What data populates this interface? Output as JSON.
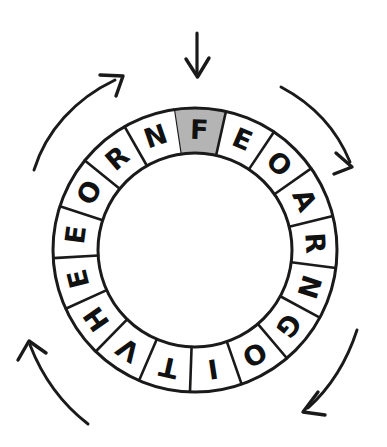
{
  "diagram": {
    "type": "cipher-wheel",
    "geometry": {
      "center_x": 195,
      "center_y": 250,
      "outer_radius": 142,
      "inner_radius": 97,
      "segment_count": 17,
      "start_angle_deg": -98.6,
      "segment_span_deg": 21.18
    },
    "colors": {
      "ink": "#1a1a1a",
      "segment_fill": "#ffffff",
      "highlight_fill": "#b4b4b4",
      "page": "#ffffff"
    },
    "segments": [
      {
        "index": 0,
        "letter": "F",
        "highlighted": true
      },
      {
        "index": 1,
        "letter": "E",
        "highlighted": false
      },
      {
        "index": 2,
        "letter": "O",
        "highlighted": false
      },
      {
        "index": 3,
        "letter": "A",
        "highlighted": false
      },
      {
        "index": 4,
        "letter": "R",
        "highlighted": false
      },
      {
        "index": 5,
        "letter": "N",
        "highlighted": false
      },
      {
        "index": 6,
        "letter": "G",
        "highlighted": false
      },
      {
        "index": 7,
        "letter": "O",
        "highlighted": false
      },
      {
        "index": 8,
        "letter": "I",
        "highlighted": false
      },
      {
        "index": 9,
        "letter": "T",
        "highlighted": false
      },
      {
        "index": 10,
        "letter": "V",
        "highlighted": false
      },
      {
        "index": 11,
        "letter": "H",
        "highlighted": false
      },
      {
        "index": 12,
        "letter": "E",
        "highlighted": false
      },
      {
        "index": 13,
        "letter": "E",
        "highlighted": false
      },
      {
        "index": 14,
        "letter": "O",
        "highlighted": false
      },
      {
        "index": 15,
        "letter": "R",
        "highlighted": false
      },
      {
        "index": 16,
        "letter": "N",
        "highlighted": false
      }
    ],
    "sequence_clockwise": "FEOARNGOITVHEEORN",
    "pointer": {
      "name": "down-arrow",
      "direction": "down",
      "target_segment_letter": "F",
      "tip_x": 197,
      "tip_y": 78
    },
    "rotation_arcs": [
      {
        "name": "arc-arrow-top-left",
        "direction": "clockwise",
        "head": "up-right"
      },
      {
        "name": "arc-arrow-top-right",
        "direction": "clockwise",
        "head": "down-right"
      },
      {
        "name": "arc-arrow-bottom-right",
        "direction": "clockwise",
        "head": "down-left"
      },
      {
        "name": "arc-arrow-bottom-left",
        "direction": "clockwise",
        "head": "up"
      }
    ],
    "ghost_text": ""
  }
}
